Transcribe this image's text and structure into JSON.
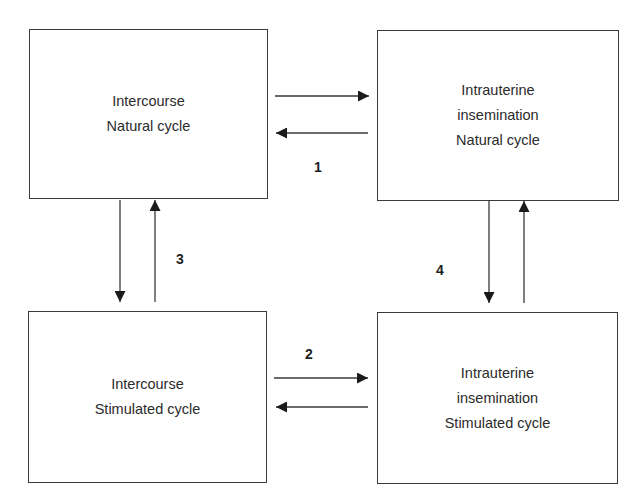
{
  "diagram": {
    "boxes": [
      {
        "id": "intercourse-natural",
        "lines": [
          "Intercourse",
          "Natural cycle"
        ]
      },
      {
        "id": "iui-natural",
        "lines": [
          "Intrauterine",
          "insemination",
          "Natural cycle"
        ]
      },
      {
        "id": "intercourse-stimulated",
        "lines": [
          "Intercourse",
          "Stimulated cycle"
        ]
      },
      {
        "id": "iui-stimulated",
        "lines": [
          "Intrauterine",
          "insemination",
          "Stimulated cycle"
        ]
      }
    ],
    "labels": [
      "1",
      "2",
      "3",
      "4"
    ],
    "edges": [
      {
        "from": "intercourse-natural",
        "to": "iui-natural"
      },
      {
        "from": "iui-natural",
        "to": "intercourse-natural"
      },
      {
        "from": "intercourse-stimulated",
        "to": "iui-stimulated"
      },
      {
        "from": "iui-stimulated",
        "to": "intercourse-stimulated"
      },
      {
        "from": "intercourse-natural",
        "to": "intercourse-stimulated"
      },
      {
        "from": "intercourse-stimulated",
        "to": "intercourse-natural"
      },
      {
        "from": "iui-natural",
        "to": "iui-stimulated"
      },
      {
        "from": "iui-stimulated",
        "to": "iui-natural"
      }
    ],
    "line_color": "#3a3a3a"
  }
}
